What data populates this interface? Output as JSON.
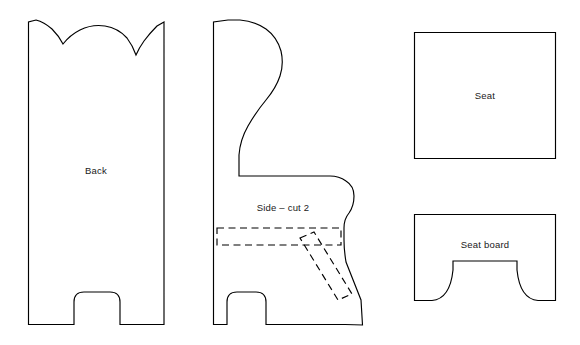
{
  "diagram": {
    "background_color": "#ffffff",
    "line_color": "#000000",
    "text_color": "#1a1a1a",
    "canvas": {
      "width": 580,
      "height": 345
    },
    "pieces": [
      {
        "id": "back",
        "label": "Back",
        "label_x": 96,
        "label_y": 171,
        "description": "Tall back panel with scalloped double-arch top and arched cutout between two feet",
        "outline": "M 28.5 22 L 28.5 324.5 L 74 324.5 L 74 302 Q 74 292 84 292 L 110 292 Q 120 292 120 302 L 120 324.5 L 164 324.5 L 164 22 L 157 26 Q 150 33 144 41 Q 139 48 136 55 Q 133 46 127 38 Q 118 28 105 26 Q 92 24 80 30 Q 70 35 63 44 Q 59 36 52 29 Q 44 22 36 20 Z"
      },
      {
        "id": "side",
        "label": "Side – cut 2",
        "label_x": 283,
        "label_y": 208,
        "description": "Wing-back chair side profile with curved back, rolled arm, arched foot cutout and angled front edge",
        "outline": "M 213.5 22 L 213.5 324.5 L 227 324.5 L 227 302 Q 227 292 237 292 L 256 292 Q 266 292 266 302 L 266 324.5 L 345 324.5 L 362.5 325 L 361 300 L 346 262 Q 344 250 344 240 L 344 228 Q 344 219 349 213 Q 354 206 354 196 Q 354 186 346 181 Q 339 176 330 176 L 239 176 L 239 155 Q 240 140 248 126 Q 256 112 266 100 Q 276 88 280 76 Q 284 64 281 51 Q 277 37 266 29 Q 254 21 240 20 L 228 20 Z"
      },
      {
        "id": "side-seat-slot",
        "label": "",
        "description": "Horizontal dashed seat slot reference on side piece",
        "outline": "M 217 228 L 341 228 L 341 245 L 217 245 Z"
      },
      {
        "id": "side-board-slot",
        "label": "",
        "description": "Angled dashed seat-board slot reference on side piece",
        "outline": "M 300 238 L 314 232 L 352 294 L 338 300 Z"
      },
      {
        "id": "seat",
        "label": "Seat",
        "label_x": 485,
        "label_y": 96,
        "description": "Plain rectangular seat panel",
        "outline": "M 414.5 32.5 L 555.5 32.5 L 555.5 158.5 L 414.5 158.5 Z"
      },
      {
        "id": "seat-board",
        "label": "Seat board",
        "label_x": 485,
        "label_y": 245,
        "description": "Seat board panel with concave quarter-round cutouts at both lower corners",
        "outline": "M 414.5 214.5 L 555.5 214.5 L 555.5 300.5 L 538 300.5 Q 520 299 517 270 L 517 261 L 453 261 L 453 270 Q 450 299 432 300.5 L 414.5 300.5 Z"
      }
    ]
  }
}
